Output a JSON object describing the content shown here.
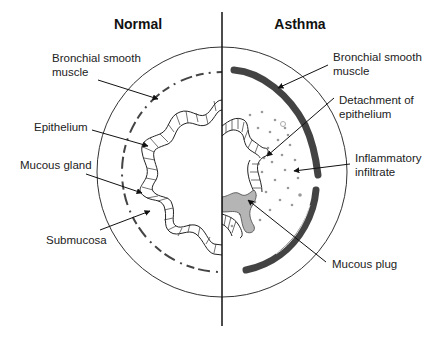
{
  "diagram": {
    "titles": {
      "left": "Normal",
      "right": "Asthma"
    },
    "normal_labels": {
      "smooth_muscle": [
        "Bronchial smooth",
        "muscle"
      ],
      "epithelium": "Epithelium",
      "mucous_gland": "Mucous gland",
      "submucosa": "Submucosa"
    },
    "asthma_labels": {
      "smooth_muscle": [
        "Bronchial smooth",
        "muscle"
      ],
      "detachment": [
        "Detachment of",
        "epithelium"
      ],
      "inflammatory": [
        "Inflammatory",
        "infiltrate"
      ],
      "mucous_plug": "Mucous plug"
    },
    "colors": {
      "line": "#222222",
      "mucous_plug_fill": "#b5b5b5",
      "background": "#ffffff"
    }
  }
}
